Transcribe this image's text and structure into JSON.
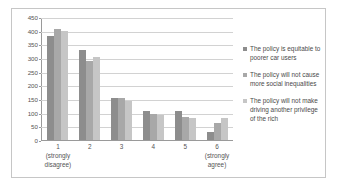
{
  "chart_data": {
    "type": "bar",
    "title": "",
    "xlabel": "",
    "ylabel": "",
    "ylim": [
      0,
      450
    ],
    "ytick_step": 50,
    "yticks": [
      0,
      50,
      100,
      150,
      200,
      250,
      300,
      350,
      400,
      450
    ],
    "grid": true,
    "legend_position": "right",
    "categories": [
      "1",
      "2",
      "3",
      "4",
      "5",
      "6"
    ],
    "category_sublabels": [
      [
        "(strongly",
        "disagree)"
      ],
      [
        "",
        ""
      ],
      [
        "",
        ""
      ],
      [
        "",
        ""
      ],
      [
        "",
        ""
      ],
      [
        "(strongly",
        "agree)"
      ]
    ],
    "series": [
      {
        "name": "The policy is equitable to poorer car users",
        "color": "#8d8d8d",
        "values": [
          379,
          330,
          153,
          105,
          105,
          31
        ]
      },
      {
        "name": "The policy will not cause more social inequalities",
        "color": "#a8a8a8",
        "values": [
          406,
          289,
          154,
          97,
          84,
          63
        ]
      },
      {
        "name": "The policy will not make driving another privilege of the rich",
        "color": "#c6c6c6",
        "values": [
          400,
          305,
          143,
          90,
          79,
          80
        ]
      }
    ]
  },
  "legend": {
    "items": [
      {
        "label": "The policy is equitable to poorer car users",
        "color": "#8d8d8d"
      },
      {
        "label": "The policy will not cause more social inequalities",
        "color": "#a8a8a8"
      },
      {
        "label": "The policy will not make driving another privilege of the rich",
        "color": "#c6c6c6"
      }
    ]
  }
}
